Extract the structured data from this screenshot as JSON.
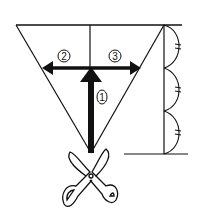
{
  "diagram": {
    "steps": [
      {
        "number": "1",
        "label": "①",
        "direction": "up"
      },
      {
        "number": "2",
        "label": "②",
        "direction": "left"
      },
      {
        "number": "3",
        "label": "③",
        "direction": "right"
      }
    ],
    "icons": [
      "scissors-icon",
      "equal-division-arcs"
    ],
    "divisions": 3,
    "colors": {
      "ink": "#111111",
      "background": "#ffffff"
    }
  }
}
